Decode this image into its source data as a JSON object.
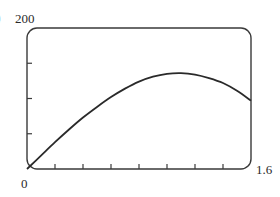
{
  "labels": {
    "cutoff_glyph": ")",
    "y_max": "200",
    "origin": "0",
    "x_max": "1.6"
  },
  "style": {
    "line_color": "#2a2a2a",
    "frame_color": "#3a3a3a",
    "background": "#ffffff"
  },
  "chart_data": {
    "type": "line",
    "title": "",
    "xlabel": "",
    "ylabel": "",
    "xlim": [
      0,
      1.6
    ],
    "ylim": [
      0,
      200
    ],
    "x_tick_labels": [
      "0",
      "1.6"
    ],
    "y_tick_labels": [
      "200"
    ],
    "x_ticks": [
      0.2,
      0.4,
      0.6,
      0.8,
      1.0,
      1.2,
      1.4
    ],
    "y_ticks": [
      50,
      100,
      150
    ],
    "grid": false,
    "legend": null,
    "series": [
      {
        "name": "curve",
        "x": [
          0,
          0.1,
          0.2,
          0.3,
          0.4,
          0.5,
          0.6,
          0.7,
          0.8,
          0.9,
          1.0,
          1.1,
          1.2,
          1.3,
          1.4,
          1.5,
          1.6
        ],
        "values": [
          0,
          19,
          38,
          56,
          73,
          88,
          102,
          114,
          124,
          131,
          135,
          136,
          134,
          129,
          122,
          111,
          97
        ]
      }
    ]
  }
}
